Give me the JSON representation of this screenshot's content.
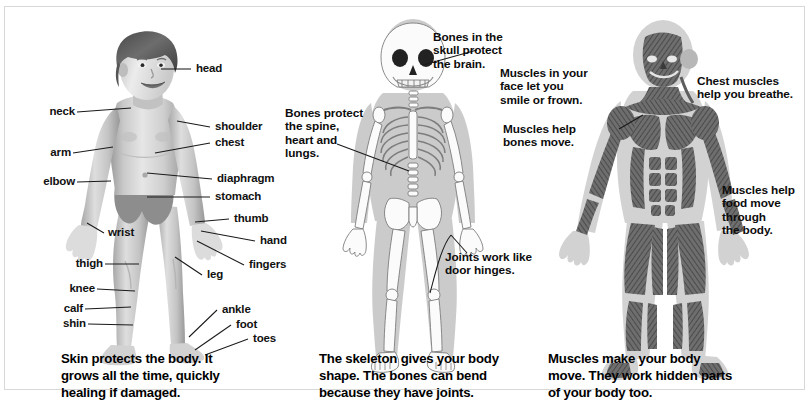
{
  "figure": {
    "panel_count": 3,
    "border_color": "#d8d8d8",
    "background_color": "#ffffff",
    "text_color": "#111111"
  },
  "panels": [
    {
      "id": "skin",
      "subject": "boy-body-parts",
      "caption": "Skin protects the body. It\ngrows all the time, quickly\nhealing if damaged.",
      "labels": [
        {
          "text": "head",
          "side": "right"
        },
        {
          "text": "neck",
          "side": "left"
        },
        {
          "text": "shoulder",
          "side": "right"
        },
        {
          "text": "arm",
          "side": "left"
        },
        {
          "text": "chest",
          "side": "right"
        },
        {
          "text": "elbow",
          "side": "left"
        },
        {
          "text": "diaphragm",
          "side": "right"
        },
        {
          "text": "stomach",
          "side": "right"
        },
        {
          "text": "wrist",
          "side": "left"
        },
        {
          "text": "thumb",
          "side": "right"
        },
        {
          "text": "hand",
          "side": "right"
        },
        {
          "text": "fingers",
          "side": "right"
        },
        {
          "text": "thigh",
          "side": "left"
        },
        {
          "text": "leg",
          "side": "right"
        },
        {
          "text": "knee",
          "side": "left"
        },
        {
          "text": "calf",
          "side": "left"
        },
        {
          "text": "ankle",
          "side": "right"
        },
        {
          "text": "shin",
          "side": "left"
        },
        {
          "text": "foot",
          "side": "right"
        },
        {
          "text": "toes",
          "side": "right"
        }
      ]
    },
    {
      "id": "bones",
      "subject": "skeleton",
      "caption": "The skeleton gives your body\nshape. The bones can bend\nbecause they have joints.",
      "notes": [
        {
          "text": "Bones in the\nskull protect\nthe brain."
        },
        {
          "text": "Bones protect\nthe spine,\nheart and\nlungs."
        },
        {
          "text": "Joints work like\ndoor hinges."
        }
      ]
    },
    {
      "id": "muscles",
      "subject": "muscular-system",
      "caption": "Muscles make your body\nmove. They work hidden parts\nof your body too.",
      "notes": [
        {
          "text": "Muscles in your\nface let you\nsmile or frown."
        },
        {
          "text": "Chest muscles\nhelp you breathe."
        },
        {
          "text": "Muscles help\nbones move."
        },
        {
          "text": "Muscles help\nfood move\nthrough\nthe body."
        }
      ]
    }
  ]
}
